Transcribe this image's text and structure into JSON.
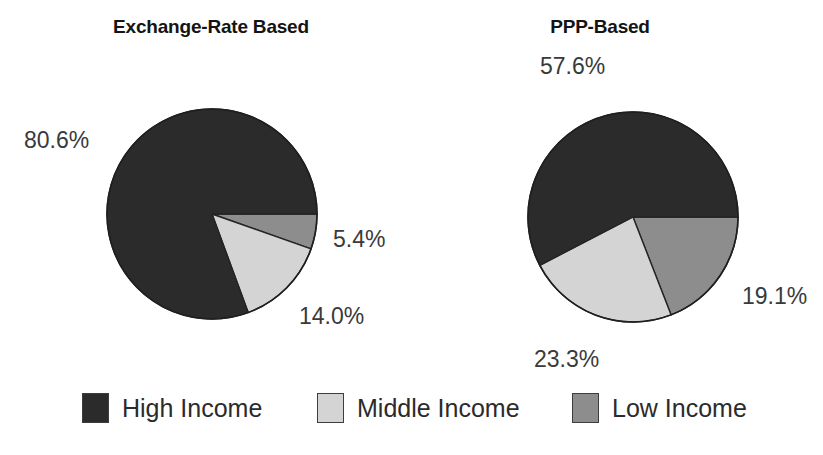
{
  "figure": {
    "background": "#ffffff",
    "width": 823,
    "height": 455
  },
  "chart_data": [
    {
      "type": "pie",
      "title": "Exchange-Rate Based",
      "labels": [
        "High Income",
        "Middle Income",
        "Low Income"
      ],
      "values": [
        80.6,
        14.0,
        5.4
      ],
      "data_labels": [
        "80.6%",
        "14.0%",
        "5.4%"
      ],
      "colors": [
        "#2b2b2b",
        "#d4d4d4",
        "#8d8d8d"
      ],
      "start_angle_deg": 0,
      "direction": "clockwise",
      "slice_order_clockwise_from_3oclock": [
        "Low Income",
        "Middle Income",
        "High Income"
      ],
      "center": [
        211,
        213
      ],
      "radius": 105,
      "legend_position": "bottom",
      "grid": false
    },
    {
      "type": "pie",
      "title": "PPP-Based",
      "labels": [
        "High Income",
        "Middle Income",
        "Low Income"
      ],
      "values": [
        57.6,
        23.3,
        19.1
      ],
      "data_labels": [
        "57.6%",
        "23.3%",
        "19.1%"
      ],
      "colors": [
        "#2b2b2b",
        "#d4d4d4",
        "#8d8d8d"
      ],
      "start_angle_deg": 0,
      "direction": "clockwise",
      "slice_order_clockwise_from_3oclock": [
        "Low Income",
        "Middle Income",
        "High Income"
      ],
      "center": [
        632,
        216
      ],
      "radius": 105,
      "legend_position": "bottom",
      "grid": false
    }
  ],
  "left_chart": {
    "title": "Exchange-Rate Based",
    "label_high": "80.6%",
    "label_middle": "14.0%",
    "label_low": "5.4%"
  },
  "right_chart": {
    "title": "PPP-Based",
    "label_high": "57.6%",
    "label_middle": "23.3%",
    "label_low": "19.1%"
  },
  "legend": {
    "items": [
      {
        "label": "High Income",
        "color": "#2b2b2b"
      },
      {
        "label": "Middle Income",
        "color": "#d4d4d4"
      },
      {
        "label": "Low Income",
        "color": "#8d8d8d"
      }
    ]
  }
}
